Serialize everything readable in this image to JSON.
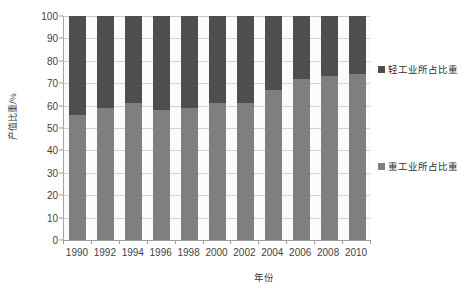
{
  "chart_data": {
    "type": "bar",
    "subtype": "stacked-100-percent",
    "title": "",
    "xlabel": "年份",
    "ylabel": "产值比重/%",
    "ylim": [
      0,
      100
    ],
    "ytick_step": 10,
    "ytick_labels": [
      "100",
      "90",
      "80",
      "70",
      "60",
      "50",
      "40",
      "30",
      "20",
      "10",
      "0"
    ],
    "ytick_values": [
      100,
      90,
      80,
      70,
      60,
      50,
      40,
      30,
      20,
      10,
      0
    ],
    "categories": [
      "1990",
      "1992",
      "1994",
      "1996",
      "1998",
      "2000",
      "2002",
      "2004",
      "2006",
      "2008",
      "2010"
    ],
    "grid": "horizontal",
    "legend_position": "right",
    "series": [
      {
        "name": "轻工业所占比重",
        "color": "#4e4e4e",
        "stack_position": "top",
        "values": [
          44,
          41,
          39,
          42,
          41,
          39,
          39,
          33,
          28,
          27,
          26
        ]
      },
      {
        "name": "重工业所占比重",
        "color": "#7f7f7f",
        "stack_position": "bottom",
        "values": [
          56,
          59,
          61,
          58,
          59,
          61,
          61,
          67,
          72,
          73,
          74
        ]
      }
    ],
    "plot_background": "#fbfbfb",
    "gridline_color": "#d3d3d3",
    "axis_color": "#9e9e9e"
  },
  "legend": {
    "entries": [
      {
        "label": "轻工业所占比重",
        "color": "#4e4e4e"
      },
      {
        "label": "重工业所占比重",
        "color": "#7f7f7f"
      }
    ]
  }
}
